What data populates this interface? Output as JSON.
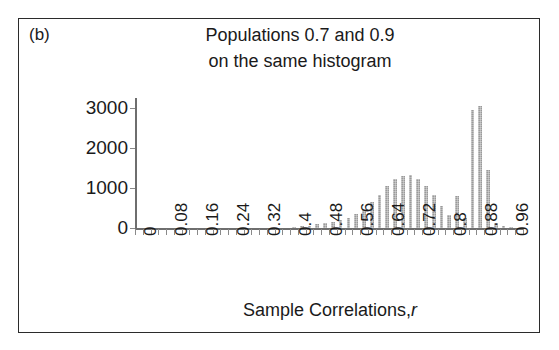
{
  "panel": {
    "label": "(b)"
  },
  "chart_data": {
    "type": "bar",
    "title": "Populations 0.7 and 0.9 on the same histogram",
    "title_lines": [
      "Populations 0.7 and 0.9",
      "on the same histogram"
    ],
    "xlabel": "Sample Correlations,",
    "xlabel_italic": "r",
    "ylabel": "Frequency",
    "ylim": [
      0,
      3250
    ],
    "yticks": [
      0,
      1000,
      2000,
      3000
    ],
    "ytick_labels": [
      "0",
      "1000",
      "2000",
      "3000"
    ],
    "xlim": [
      0,
      1.0
    ],
    "xticks": [
      0,
      0.08,
      0.16,
      0.24,
      0.32,
      0.4,
      0.48,
      0.56,
      0.64,
      0.72,
      0.8,
      0.88,
      0.96
    ],
    "xtick_labels": [
      "0",
      "0.08",
      "0.16",
      "0.24",
      "0.32",
      "0.4",
      "0.48",
      "0.56",
      "0.64",
      "0.72",
      "0.8",
      "0.88",
      "0.96"
    ],
    "bin_width": 0.02,
    "grid": false,
    "legend": false,
    "bar_color": "#9a9a9a",
    "x": [
      0.41,
      0.43,
      0.45,
      0.47,
      0.49,
      0.51,
      0.53,
      0.55,
      0.57,
      0.59,
      0.61,
      0.63,
      0.65,
      0.67,
      0.69,
      0.71,
      0.73,
      0.75,
      0.77,
      0.79,
      0.81,
      0.83,
      0.85,
      0.87,
      0.89,
      0.91,
      0.93,
      0.95,
      0.97
    ],
    "values": [
      30,
      50,
      60,
      90,
      120,
      150,
      190,
      260,
      340,
      470,
      640,
      830,
      1050,
      1230,
      1290,
      1330,
      1220,
      1060,
      830,
      560,
      330,
      800,
      260,
      2960,
      3050,
      1460,
      120,
      40,
      20
    ],
    "series": [
      {
        "name": "Populations 0.7 and 0.9 combined",
        "categories": [
          "0.41",
          "0.43",
          "0.45",
          "0.47",
          "0.49",
          "0.51",
          "0.53",
          "0.55",
          "0.57",
          "0.59",
          "0.61",
          "0.63",
          "0.65",
          "0.67",
          "0.69",
          "0.71",
          "0.73",
          "0.75",
          "0.77",
          "0.79",
          "0.81",
          "0.83",
          "0.85",
          "0.87",
          "0.89",
          "0.91",
          "0.93",
          "0.95",
          "0.97"
        ],
        "values": [
          30,
          50,
          60,
          90,
          120,
          150,
          190,
          260,
          340,
          470,
          640,
          830,
          1050,
          1230,
          1290,
          1330,
          1220,
          1060,
          830,
          560,
          330,
          800,
          260,
          2960,
          3050,
          1460,
          120,
          40,
          20
        ]
      }
    ],
    "annotations": []
  }
}
